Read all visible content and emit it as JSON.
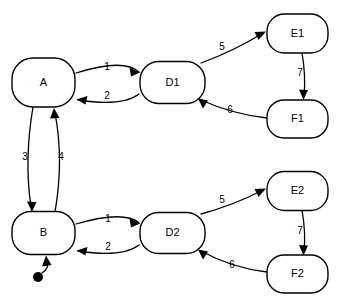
{
  "diagram": {
    "type": "state-machine-diagram",
    "background_color": "#ffffff",
    "stroke_color": "#000000",
    "states": [
      {
        "id": "A",
        "label": "A",
        "cx": 43.5,
        "cy": 82.5,
        "w": 63,
        "h": 49
      },
      {
        "id": "B",
        "label": "B",
        "cx": 43.5,
        "cy": 233.0,
        "w": 63,
        "h": 43
      },
      {
        "id": "D1",
        "label": "D1",
        "cx": 172.5,
        "cy": 82.5,
        "w": 65,
        "h": 42
      },
      {
        "id": "D2",
        "label": "D2",
        "cx": 172.5,
        "cy": 233.0,
        "w": 65,
        "h": 41
      },
      {
        "id": "E1",
        "label": "E1",
        "cx": 297.5,
        "cy": 33.5,
        "w": 61,
        "h": 39
      },
      {
        "id": "F1",
        "label": "F1",
        "cx": 297.5,
        "cy": 119.0,
        "w": 61,
        "h": 38
      },
      {
        "id": "E2",
        "label": "E2",
        "cx": 297.5,
        "cy": 191.0,
        "w": 61,
        "h": 39
      },
      {
        "id": "F2",
        "label": "F2",
        "cx": 297.5,
        "cy": 274.0,
        "w": 61,
        "h": 38
      }
    ],
    "transitions": [
      {
        "id": "t1-top",
        "from": "A",
        "to": "D1",
        "label": "1",
        "label_x": 107,
        "label_y": 67
      },
      {
        "id": "t2-top",
        "from": "D1",
        "to": "A",
        "label": "2",
        "label_x": 107,
        "label_y": 96
      },
      {
        "id": "t5-top",
        "from": "D1",
        "to": "E1",
        "label": "5",
        "label_x": 222,
        "label_y": 47
      },
      {
        "id": "t7-top",
        "from": "E1",
        "to": "F1",
        "label": "7",
        "label_x": 300,
        "label_y": 73
      },
      {
        "id": "t6-top",
        "from": "F1",
        "to": "D1",
        "label": "6",
        "label_x": 230,
        "label_y": 110
      },
      {
        "id": "t3-a-to-b",
        "from": "A",
        "to": "B",
        "label": "3",
        "label_x": 25,
        "label_y": 157
      },
      {
        "id": "t4-b-to-a",
        "from": "B",
        "to": "A",
        "label": "4",
        "label_x": 61,
        "label_y": 157
      },
      {
        "id": "t1-bot",
        "from": "B",
        "to": "D2",
        "label": "1",
        "label_x": 108,
        "label_y": 219
      },
      {
        "id": "t2-bot",
        "from": "D2",
        "to": "B",
        "label": "2",
        "label_x": 108,
        "label_y": 247
      },
      {
        "id": "t5-bot",
        "from": "D2",
        "to": "E2",
        "label": "5",
        "label_x": 222,
        "label_y": 200
      },
      {
        "id": "t7-bot",
        "from": "E2",
        "to": "F2",
        "label": "7",
        "label_x": 300,
        "label_y": 231
      },
      {
        "id": "t6-bot",
        "from": "F2",
        "to": "D2",
        "label": "6",
        "label_x": 232,
        "label_y": 265
      }
    ],
    "initial_marker": {
      "id": "initial-state",
      "target": "B",
      "dot_x": 38,
      "dot_y": 277,
      "dot_r": 5
    }
  }
}
